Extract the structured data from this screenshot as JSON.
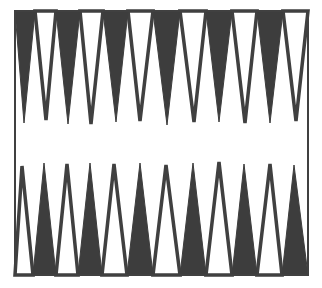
{
  "board": {
    "name": "backgammon-board",
    "frame": {
      "left": 15,
      "top": 11,
      "right": 308,
      "bottom": 275,
      "stroke": "#404040",
      "stroke_width": 2
    },
    "colors": {
      "dark_point": "#3d3d3d",
      "light_point": "#ffffff",
      "outline": "#404040",
      "background": "#ffffff"
    },
    "top_points": [
      {
        "index": 1,
        "left": 15,
        "right": 35,
        "apex_x": 24,
        "apex_y": 123,
        "style": "dark"
      },
      {
        "index": 2,
        "left": 35,
        "right": 56,
        "apex_x": 46,
        "apex_y": 120,
        "style": "light"
      },
      {
        "index": 3,
        "left": 56,
        "right": 80,
        "apex_x": 68,
        "apex_y": 124,
        "style": "dark"
      },
      {
        "index": 4,
        "left": 80,
        "right": 103,
        "apex_x": 91,
        "apex_y": 124,
        "style": "light"
      },
      {
        "index": 5,
        "left": 103,
        "right": 128,
        "apex_x": 116,
        "apex_y": 122,
        "style": "dark"
      },
      {
        "index": 6,
        "left": 128,
        "right": 153,
        "apex_x": 140,
        "apex_y": 121,
        "style": "light"
      },
      {
        "index": 7,
        "left": 153,
        "right": 180,
        "apex_x": 167,
        "apex_y": 125,
        "style": "dark"
      },
      {
        "index": 8,
        "left": 180,
        "right": 206,
        "apex_x": 194,
        "apex_y": 122,
        "style": "light"
      },
      {
        "index": 9,
        "left": 206,
        "right": 232,
        "apex_x": 219,
        "apex_y": 122,
        "style": "dark"
      },
      {
        "index": 10,
        "left": 232,
        "right": 257,
        "apex_x": 245,
        "apex_y": 123,
        "style": "light"
      },
      {
        "index": 11,
        "left": 257,
        "right": 283,
        "apex_x": 270,
        "apex_y": 123,
        "style": "dark"
      },
      {
        "index": 12,
        "left": 283,
        "right": 308,
        "apex_x": 296,
        "apex_y": 121,
        "style": "light"
      }
    ],
    "bottom_points": [
      {
        "index": 13,
        "left": 15,
        "right": 33,
        "apex_x": 22,
        "apex_y": 166,
        "style": "light"
      },
      {
        "index": 14,
        "left": 33,
        "right": 56,
        "apex_x": 44,
        "apex_y": 163,
        "style": "dark"
      },
      {
        "index": 15,
        "left": 56,
        "right": 78,
        "apex_x": 67,
        "apex_y": 164,
        "style": "light"
      },
      {
        "index": 16,
        "left": 78,
        "right": 102,
        "apex_x": 90,
        "apex_y": 163,
        "style": "dark"
      },
      {
        "index": 17,
        "left": 102,
        "right": 127,
        "apex_x": 114,
        "apex_y": 164,
        "style": "light"
      },
      {
        "index": 18,
        "left": 127,
        "right": 153,
        "apex_x": 140,
        "apex_y": 163,
        "style": "dark"
      },
      {
        "index": 19,
        "left": 153,
        "right": 180,
        "apex_x": 166,
        "apex_y": 165,
        "style": "light"
      },
      {
        "index": 20,
        "left": 180,
        "right": 206,
        "apex_x": 193,
        "apex_y": 163,
        "style": "dark"
      },
      {
        "index": 21,
        "left": 206,
        "right": 232,
        "apex_x": 219,
        "apex_y": 162,
        "style": "light"
      },
      {
        "index": 22,
        "left": 232,
        "right": 257,
        "apex_x": 244,
        "apex_y": 164,
        "style": "dark"
      },
      {
        "index": 23,
        "left": 257,
        "right": 282,
        "apex_x": 270,
        "apex_y": 164,
        "style": "light"
      },
      {
        "index": 24,
        "left": 282,
        "right": 308,
        "apex_x": 294,
        "apex_y": 165,
        "style": "dark"
      }
    ]
  }
}
